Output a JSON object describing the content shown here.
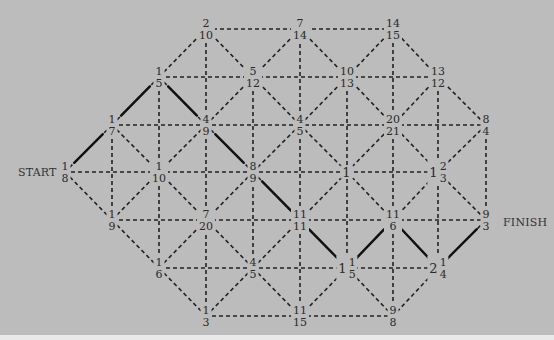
{
  "labels": {
    "start": "START",
    "finish": "FINISH"
  },
  "colors": {
    "background": "#bcbcbc",
    "line": "#222222",
    "path": "#111111"
  },
  "nodes": [
    {
      "id": "n_2_10",
      "x": 206,
      "y": 29,
      "num": "2",
      "den": "10"
    },
    {
      "id": "n_7_14",
      "x": 300,
      "y": 29,
      "num": "7",
      "den": "14"
    },
    {
      "id": "n_14_15",
      "x": 393,
      "y": 29,
      "num": "14",
      "den": "15"
    },
    {
      "id": "n_1_5",
      "x": 159,
      "y": 77,
      "num": "1",
      "den": "5"
    },
    {
      "id": "n_5_12",
      "x": 253,
      "y": 77,
      "num": "5",
      "den": "12"
    },
    {
      "id": "n_10_13",
      "x": 347,
      "y": 77,
      "num": "10",
      "den": "13"
    },
    {
      "id": "n_13_12",
      "x": 438,
      "y": 77,
      "num": "13",
      "den": "12"
    },
    {
      "id": "n_1_7",
      "x": 112,
      "y": 125,
      "num": "1",
      "den": "7"
    },
    {
      "id": "n_4_9",
      "x": 206,
      "y": 125,
      "num": "4",
      "den": "9"
    },
    {
      "id": "n_4_5a",
      "x": 300,
      "y": 125,
      "num": "4",
      "den": "5"
    },
    {
      "id": "n_20_21",
      "x": 393,
      "y": 125,
      "num": "20",
      "den": "21"
    },
    {
      "id": "n_8_4",
      "x": 486,
      "y": 125,
      "num": "8",
      "den": "4"
    },
    {
      "id": "n_1_8",
      "x": 65,
      "y": 172,
      "num": "1",
      "den": "8"
    },
    {
      "id": "n_1_10",
      "x": 159,
      "y": 172,
      "num": "1",
      "den": "10"
    },
    {
      "id": "n_8_9",
      "x": 253,
      "y": 172,
      "num": "8",
      "den": "9"
    },
    {
      "id": "n_1",
      "x": 347,
      "y": 172,
      "whole": "1"
    },
    {
      "id": "n_1_2_3",
      "x": 438,
      "y": 172,
      "whole": "1",
      "num": "2",
      "den": "3"
    },
    {
      "id": "n_1_9",
      "x": 112,
      "y": 220,
      "num": "1",
      "den": "9"
    },
    {
      "id": "n_7_20",
      "x": 206,
      "y": 220,
      "num": "7",
      "den": "20"
    },
    {
      "id": "n_11_11",
      "x": 300,
      "y": 220,
      "num": "11",
      "den": "11"
    },
    {
      "id": "n_11_6",
      "x": 393,
      "y": 220,
      "num": "11",
      "den": "6"
    },
    {
      "id": "n_9_3",
      "x": 486,
      "y": 220,
      "num": "9",
      "den": "3"
    },
    {
      "id": "n_1_6",
      "x": 159,
      "y": 268,
      "num": "1",
      "den": "6"
    },
    {
      "id": "n_4_5b",
      "x": 253,
      "y": 268,
      "num": "4",
      "den": "5"
    },
    {
      "id": "n_1_1_5",
      "x": 347,
      "y": 268,
      "whole": "1",
      "num": "1",
      "den": "5"
    },
    {
      "id": "n_2_1_4",
      "x": 438,
      "y": 268,
      "whole": "2",
      "num": "1",
      "den": "4"
    },
    {
      "id": "n_1_3",
      "x": 206,
      "y": 316,
      "num": "1",
      "den": "3"
    },
    {
      "id": "n_11_15",
      "x": 300,
      "y": 316,
      "num": "11",
      "den": "15"
    },
    {
      "id": "n_9_8",
      "x": 393,
      "y": 316,
      "num": "9",
      "den": "8"
    }
  ],
  "path_edges": [
    [
      "n_1_8",
      "n_1_7"
    ],
    [
      "n_1_7",
      "n_1_5"
    ],
    [
      "n_1_5",
      "n_4_9"
    ],
    [
      "n_4_9",
      "n_8_9"
    ],
    [
      "n_8_9",
      "n_11_11"
    ],
    [
      "n_11_11",
      "n_1_1_5"
    ],
    [
      "n_1_1_5",
      "n_11_6"
    ],
    [
      "n_11_6",
      "n_2_1_4"
    ],
    [
      "n_2_1_4",
      "n_9_3"
    ]
  ]
}
